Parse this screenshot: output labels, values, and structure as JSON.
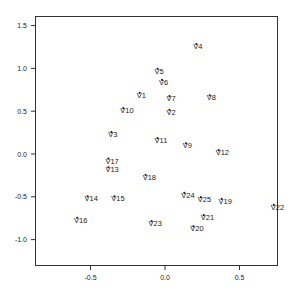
{
  "chart_data": {
    "type": "scatter",
    "title": "",
    "xlabel": "",
    "ylabel": "",
    "xlim": [
      -0.85,
      0.77
    ],
    "ylim": [
      -1.3,
      1.62
    ],
    "xticks": [
      -0.5,
      0.0,
      0.5
    ],
    "xtick_labels": [
      "-0.5",
      "0.0",
      "0.5"
    ],
    "yticks": [
      -1.0,
      -0.5,
      0.0,
      0.5,
      1.0,
      1.5
    ],
    "ytick_labels": [
      "-1.0",
      "-0.5",
      "0.0",
      "0.5",
      "1.0",
      "1.5"
    ],
    "grid": false,
    "legend": null,
    "points": [
      {
        "label": "V1",
        "x": -0.17,
        "y": 0.68
      },
      {
        "label": "V2",
        "x": 0.03,
        "y": 0.48
      },
      {
        "label": "V3",
        "x": -0.36,
        "y": 0.22
      },
      {
        "label": "V4",
        "x": 0.21,
        "y": 1.25
      },
      {
        "label": "V5",
        "x": -0.05,
        "y": 0.96
      },
      {
        "label": "V6",
        "x": -0.02,
        "y": 0.83
      },
      {
        "label": "V7",
        "x": 0.03,
        "y": 0.64
      },
      {
        "label": "V8",
        "x": 0.3,
        "y": 0.65
      },
      {
        "label": "V9",
        "x": 0.14,
        "y": 0.09
      },
      {
        "label": "V10",
        "x": -0.28,
        "y": 0.5
      },
      {
        "label": "V11",
        "x": -0.05,
        "y": 0.15
      },
      {
        "label": "V12",
        "x": 0.36,
        "y": 0.01
      },
      {
        "label": "V13",
        "x": -0.38,
        "y": -0.19
      },
      {
        "label": "V14",
        "x": -0.52,
        "y": -0.53
      },
      {
        "label": "V15",
        "x": -0.34,
        "y": -0.53
      },
      {
        "label": "V16",
        "x": -0.59,
        "y": -0.78
      },
      {
        "label": "V17",
        "x": -0.38,
        "y": -0.09
      },
      {
        "label": "V18",
        "x": -0.13,
        "y": -0.28
      },
      {
        "label": "V19",
        "x": 0.38,
        "y": -0.56
      },
      {
        "label": "V20",
        "x": 0.19,
        "y": -0.88
      },
      {
        "label": "V21",
        "x": 0.26,
        "y": -0.75
      },
      {
        "label": "V22",
        "x": 0.73,
        "y": -0.63
      },
      {
        "label": "V23",
        "x": -0.09,
        "y": -0.82
      },
      {
        "label": "V24",
        "x": 0.13,
        "y": -0.49
      },
      {
        "label": "V25",
        "x": 0.24,
        "y": -0.54
      }
    ]
  }
}
